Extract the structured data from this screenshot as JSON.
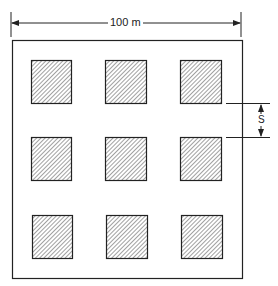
{
  "diagram": {
    "width_label": "100 m",
    "spacing_label": "S",
    "grid": {
      "rows": 3,
      "cols": 3
    },
    "colors": {
      "line": "#222222",
      "hatch": "#333333",
      "background": "#ffffff"
    }
  }
}
